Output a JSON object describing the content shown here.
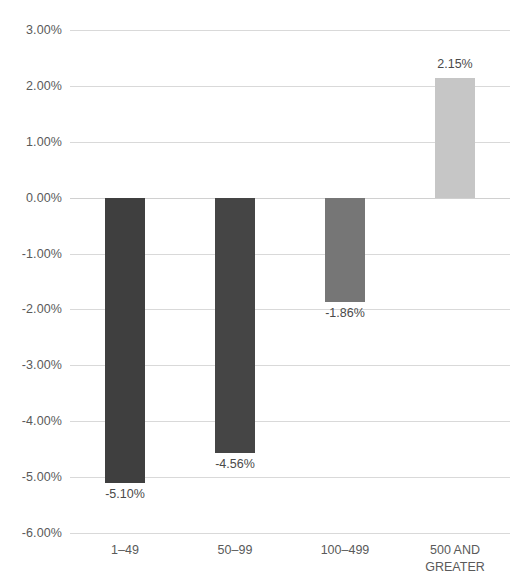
{
  "chart_data": {
    "type": "bar",
    "title": "",
    "subtitle": "",
    "xlabel": "",
    "ylabel": "",
    "categories": [
      "1–49",
      "50–99",
      "100–499",
      "500 AND\nGREATER"
    ],
    "values": [
      -5.1,
      -4.56,
      -1.86,
      2.15
    ],
    "value_labels": [
      "-5.10%",
      "-4.56%",
      "-1.86%",
      "2.15%"
    ],
    "bar_colors": [
      "#3f3f3f",
      "#454545",
      "#767676",
      "#c6c6c6"
    ],
    "ylim": [
      -6.0,
      3.0
    ],
    "ytick_values": [
      3.0,
      2.0,
      1.0,
      0.0,
      -1.0,
      -2.0,
      -3.0,
      -4.0,
      -5.0,
      -6.0
    ],
    "ytick_labels": [
      "3.00%",
      "2.00%",
      "1.00%",
      "0.00%",
      "-1.00%",
      "-2.00%",
      "-3.00%",
      "-4.00%",
      "-5.00%",
      "-6.00%"
    ],
    "grid": true,
    "grid_axis": "y",
    "legend": false,
    "legend_position": "none",
    "gridline_color": "#d9d9d9",
    "axis_text_color": "#5a5a5a"
  }
}
